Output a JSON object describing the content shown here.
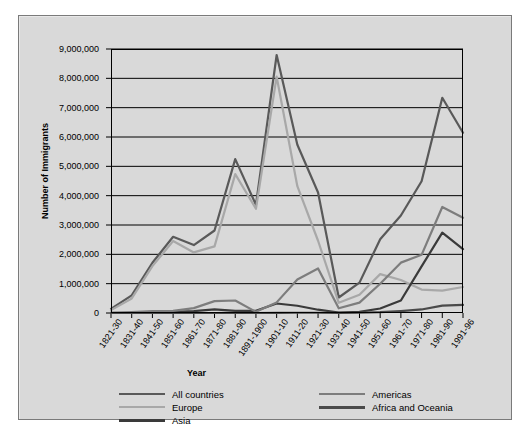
{
  "chart_data": {
    "type": "line",
    "title": "",
    "xlabel": "Year",
    "ylabel": "Number of Immigrants",
    "ylim": [
      0,
      9000000
    ],
    "ytick_values": [
      0,
      1000000,
      2000000,
      3000000,
      4000000,
      5000000,
      6000000,
      7000000,
      8000000,
      9000000
    ],
    "ytick_labels": [
      "0",
      "1,000,000",
      "2,000,000",
      "3,000,000",
      "4,000,000",
      "5,000,000",
      "6,000,000",
      "7,000,000",
      "8,000,000",
      "9,000,000"
    ],
    "grid": true,
    "legend_position": "bottom",
    "categories": [
      "1821-30",
      "1831-40",
      "1841-50",
      "1851-60",
      "1861-70",
      "1871-80",
      "1881-90",
      "1891-1900",
      "1901-10",
      "1911-20",
      "1921-30",
      "1931-40",
      "1941-50",
      "1951-60",
      "1961-70",
      "1971-80",
      "1981-90",
      "1991-96"
    ],
    "series": [
      {
        "name": "All countries",
        "color": "#595959",
        "width": 2.2,
        "values": [
          143000,
          599000,
          1713000,
          2598000,
          2315000,
          2812000,
          5247000,
          3688000,
          8795000,
          5736000,
          4107000,
          528000,
          1035000,
          2515000,
          3322000,
          4493000,
          7338000,
          6146000
        ]
      },
      {
        "name": "Europe",
        "color": "#a8a8a8",
        "width": 2.2,
        "values": [
          98000,
          496000,
          1597000,
          2453000,
          2065000,
          2272000,
          4735000,
          3555000,
          8056000,
          4322000,
          2463000,
          348000,
          621000,
          1326000,
          1123000,
          800000,
          762000,
          886000
        ]
      },
      {
        "name": "Asia",
        "color": "#3a3a3a",
        "width": 2.2,
        "values": [
          34,
          55,
          141,
          41500,
          64700,
          124200,
          69900,
          74900,
          323500,
          247200,
          112100,
          16600,
          37000,
          153200,
          427600,
          1588200,
          2738200,
          2176000
        ]
      },
      {
        "name": "Americas",
        "color": "#7d7d7d",
        "width": 2.2,
        "values": [
          11600,
          33400,
          62500,
          74700,
          166600,
          404000,
          426900,
          38900,
          361900,
          1143700,
          1516700,
          160000,
          354800,
          996900,
          1716400,
          1982700,
          3615200,
          3245000
        ]
      },
      {
        "name": "Africa and Oceania",
        "color": "#4a4a4a",
        "width": 2.2,
        "values": [
          17,
          54,
          55,
          210,
          312,
          358,
          857,
          350,
          7368,
          8443,
          7734,
          2120,
          9300,
          27200,
          66500,
          120500,
          253200,
          278000
        ]
      }
    ]
  },
  "legend": {
    "left_items": [
      {
        "label": "All countries",
        "color": "#595959",
        "width": 2.6
      },
      {
        "label": "Europe",
        "color": "#a8a8a8",
        "width": 2.2
      },
      {
        "label": "Asia",
        "color": "#3a3a3a",
        "width": 3.0
      }
    ],
    "right_items": [
      {
        "label": "Americas",
        "color": "#7d7d7d",
        "width": 2.2
      },
      {
        "label": "Africa and Oceania",
        "color": "#4a4a4a",
        "width": 3.0
      }
    ]
  },
  "style": {
    "figure_background": "#d9d9d9",
    "figure_border": "#7a7a7a",
    "axis_color": "#000000",
    "page_background": "#ffffff"
  }
}
